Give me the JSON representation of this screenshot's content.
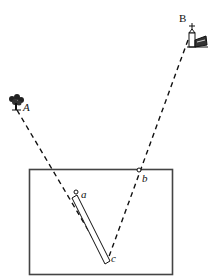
{
  "diagram": {
    "type": "surveying-plane-table-sighting",
    "labels": {
      "A": "A",
      "B": "B",
      "a": "a",
      "b": "b",
      "c": "c"
    },
    "landmarks": [
      {
        "id": "A",
        "name": "tree",
        "icon": "tree-icon"
      },
      {
        "id": "B",
        "name": "church tower",
        "icon": "church-icon"
      }
    ],
    "sight_lines": [
      {
        "from": "A",
        "to": "c",
        "via": "a",
        "style": "dashed"
      },
      {
        "from": "B",
        "to": "c",
        "via": "b",
        "style": "dashed"
      }
    ],
    "plane_table": {
      "shape": "rectangle"
    },
    "alidade": {
      "from": "a",
      "to": "c",
      "shape": "ruler"
    },
    "colors": {
      "ink": "#111111",
      "background": "#ffffff",
      "frame": "#444444"
    }
  }
}
